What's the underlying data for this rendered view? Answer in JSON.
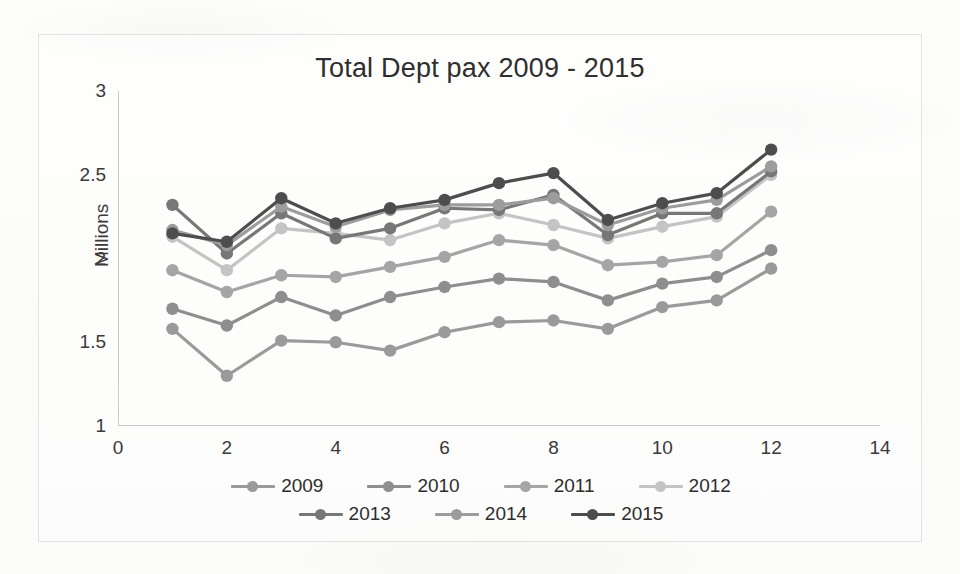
{
  "chart_data": {
    "type": "line",
    "title": "Total Dept pax 2009 - 2015",
    "xlabel": "",
    "ylabel": "Millions",
    "xlim": [
      0,
      14
    ],
    "ylim": [
      1,
      3
    ],
    "x_ticks": [
      "0",
      "2",
      "4",
      "6",
      "8",
      "10",
      "12",
      "14"
    ],
    "y_ticks": [
      "1",
      "1.5",
      "2",
      "2.5",
      "3"
    ],
    "grid": false,
    "legend_position": "bottom",
    "x": [
      1,
      2,
      3,
      4,
      5,
      6,
      7,
      8,
      9,
      10,
      11,
      12
    ],
    "series": [
      {
        "name": "2009",
        "color": "#9a9a9a",
        "values": [
          1.58,
          1.3,
          1.51,
          1.5,
          1.45,
          1.56,
          1.62,
          1.63,
          1.58,
          1.71,
          1.75,
          1.94
        ]
      },
      {
        "name": "2010",
        "color": "#8e8e8e",
        "values": [
          1.7,
          1.6,
          1.77,
          1.66,
          1.77,
          1.83,
          1.88,
          1.86,
          1.75,
          1.85,
          1.89,
          2.05
        ]
      },
      {
        "name": "2011",
        "color": "#a5a5a5",
        "values": [
          1.93,
          1.8,
          1.9,
          1.89,
          1.95,
          2.01,
          2.11,
          2.08,
          1.96,
          1.98,
          2.02,
          2.28
        ]
      },
      {
        "name": "2012",
        "color": "#c4c4c4",
        "values": [
          2.13,
          1.93,
          2.18,
          2.15,
          2.11,
          2.21,
          2.27,
          2.2,
          2.12,
          2.19,
          2.25,
          2.5
        ]
      },
      {
        "name": "2013",
        "color": "#777777",
        "values": [
          2.32,
          2.03,
          2.27,
          2.12,
          2.18,
          2.3,
          2.29,
          2.38,
          2.14,
          2.27,
          2.27,
          2.52
        ]
      },
      {
        "name": "2014",
        "color": "#9c9c9c",
        "values": [
          2.17,
          2.08,
          2.31,
          2.19,
          2.29,
          2.32,
          2.32,
          2.36,
          2.2,
          2.3,
          2.35,
          2.55
        ]
      },
      {
        "name": "2015",
        "color": "#4d4d4d",
        "values": [
          2.15,
          2.1,
          2.36,
          2.21,
          2.3,
          2.35,
          2.45,
          2.51,
          2.23,
          2.33,
          2.39,
          2.65
        ]
      }
    ]
  },
  "legend": {
    "rows": [
      [
        "2009",
        "2010",
        "2011",
        "2012"
      ],
      [
        "2013",
        "2014",
        "2015"
      ]
    ]
  }
}
